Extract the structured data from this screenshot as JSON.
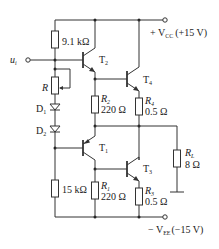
{
  "input": {
    "label": "u",
    "sub": "i"
  },
  "supplies": {
    "positive": {
      "label": "+ V",
      "sub": "CC",
      "value": "(+15 V)"
    },
    "negative": {
      "label": "− V",
      "sub": "EE",
      "value": "(−15 V)"
    }
  },
  "components": {
    "r_top": {
      "value": "9.1 kΩ"
    },
    "r_adj": {
      "name": "R"
    },
    "d1": {
      "name": "D",
      "sub": "1"
    },
    "d2": {
      "name": "D",
      "sub": "2"
    },
    "r_bottom": {
      "value": "15 kΩ"
    },
    "t1": {
      "name": "T",
      "sub": "1"
    },
    "t2": {
      "name": "T",
      "sub": "2"
    },
    "t3": {
      "name": "T",
      "sub": "3"
    },
    "t4": {
      "name": "T",
      "sub": "4"
    },
    "r1": {
      "name": "R",
      "sub": "1",
      "value": "220 Ω"
    },
    "r2": {
      "name": "R",
      "sub": "2",
      "value": "220 Ω"
    },
    "r3": {
      "name": "R",
      "sub": "3",
      "value": "0.5 Ω"
    },
    "r4": {
      "name": "R",
      "sub": "4",
      "value": "0.5 Ω"
    },
    "rl": {
      "name": "R",
      "sub": "L",
      "value": "8 Ω"
    }
  }
}
